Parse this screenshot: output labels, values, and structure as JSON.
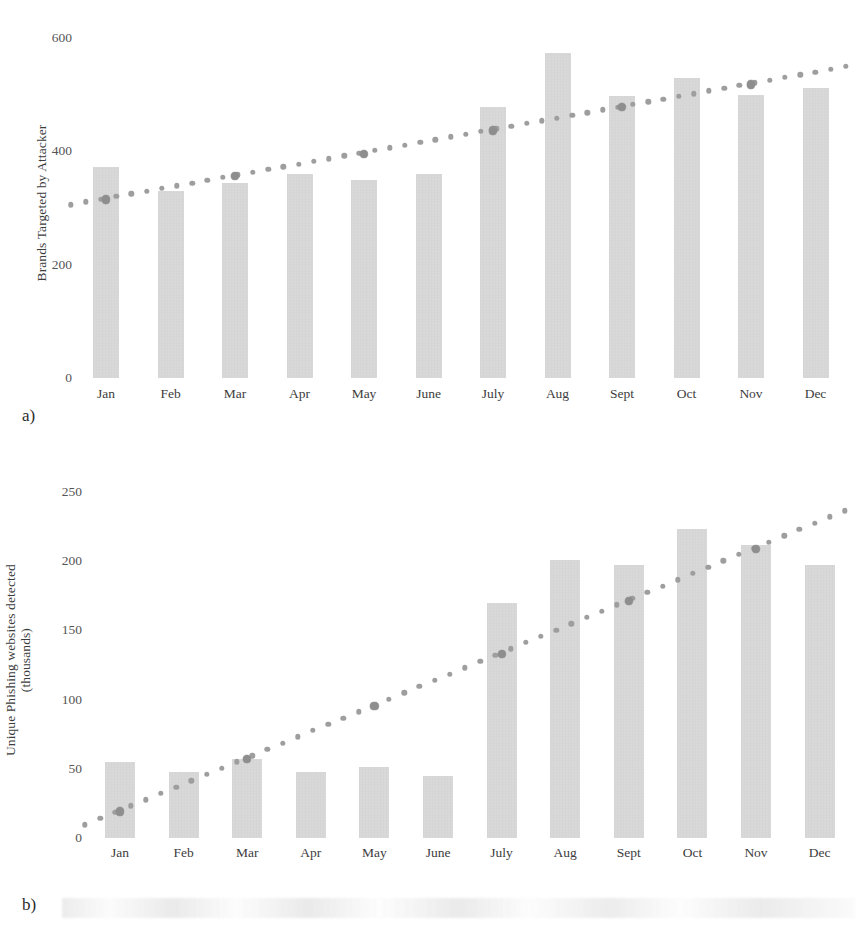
{
  "figure": {
    "panel_a_caption": "a)",
    "panel_b_caption": "b)"
  },
  "colors": {
    "bar_fill": "#d3d3d3",
    "trend_dot": "#9e9e9e",
    "marker_dot": "#8e8e8e",
    "text": "#3c3c3c",
    "background": "#ffffff"
  },
  "chart_data": [
    {
      "id": "panel-a",
      "type": "bar",
      "title": "",
      "xlabel": "",
      "ylabel": "Brands Targeted by Attacker",
      "categories": [
        "Jan",
        "Feb",
        "Mar",
        "Apr",
        "May",
        "June",
        "July",
        "Aug",
        "Sept",
        "Oct",
        "Nov",
        "Dec"
      ],
      "values": [
        372,
        330,
        345,
        360,
        350,
        360,
        478,
        573,
        497,
        530,
        500,
        512
      ],
      "yticks": [
        0,
        200,
        400,
        600
      ],
      "ytick_labels": [
        "0",
        "200",
        "400",
        "600"
      ],
      "ylim": [
        0,
        600
      ],
      "grid": false,
      "legend": "none",
      "series": [
        {
          "name": "Brands Targeted by Attacker",
          "kind": "bar",
          "values": [
            372,
            330,
            345,
            360,
            350,
            360,
            478,
            573,
            497,
            530,
            500,
            512
          ]
        },
        {
          "name": "Linear trend",
          "kind": "dotted-line",
          "style": "dotted",
          "values": [
            322,
            342,
            363,
            383,
            403,
            424,
            444,
            464,
            485,
            505,
            525,
            545
          ]
        }
      ]
    },
    {
      "id": "panel-b",
      "type": "bar",
      "title": "",
      "xlabel": "",
      "ylabel": "Unique Phishing websites detected (thousands)",
      "ylabel_line1": "Unique Phishing websites detected",
      "ylabel_line2": "(thousands)",
      "categories": [
        "Jan",
        "Feb",
        "Mar",
        "Apr",
        "May",
        "June",
        "July",
        "Aug",
        "Sept",
        "Oct",
        "Nov",
        "Dec"
      ],
      "values": [
        55,
        48,
        57,
        48,
        51,
        45,
        170,
        201,
        197,
        223,
        212,
        197
      ],
      "yticks": [
        0,
        50,
        100,
        150,
        200,
        250
      ],
      "ytick_labels": [
        "0",
        "50",
        "100",
        "150",
        "200",
        "250"
      ],
      "ylim": [
        0,
        250
      ],
      "grid": false,
      "legend": "none",
      "series": [
        {
          "name": "Unique Phishing websites detected (thousands)",
          "kind": "bar",
          "values": [
            55,
            48,
            57,
            48,
            51,
            45,
            170,
            201,
            197,
            223,
            212,
            197
          ]
        },
        {
          "name": "Linear trend",
          "kind": "dotted-line",
          "style": "dotted",
          "values": [
            22,
            41,
            60,
            79,
            98,
            117,
            136,
            155,
            174,
            193,
            212,
            231
          ]
        }
      ]
    }
  ]
}
